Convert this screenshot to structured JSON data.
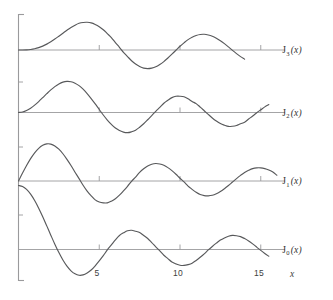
{
  "chart_data": {
    "type": "line",
    "title": "",
    "subtitle": "",
    "xlabel": "x",
    "ylabel": "",
    "xlim": [
      0,
      16.2
    ],
    "ylim": [
      -0.45,
      1.05
    ],
    "grid": false,
    "legend_position": "right-inline",
    "xticks": [
      5,
      10,
      15
    ],
    "xticklabels": [
      "5",
      "10",
      "15"
    ],
    "yticks": [],
    "yticklabels": [],
    "annotations": [],
    "series": [
      {
        "name": "J_0(x)",
        "label_base": "J",
        "label_sub": "0",
        "label_arg": "(x)",
        "baseline_value": 0,
        "x": [
          0,
          0.25,
          0.5,
          0.75,
          1,
          1.25,
          1.5,
          1.75,
          2,
          2.25,
          2.5,
          2.75,
          3,
          3.25,
          3.5,
          3.75,
          4,
          4.25,
          4.5,
          4.75,
          5,
          5.25,
          5.5,
          5.75,
          6,
          6.25,
          6.5,
          6.75,
          7,
          7.25,
          7.5,
          7.75,
          8,
          8.25,
          8.5,
          8.75,
          9,
          9.25,
          9.5,
          9.75,
          10,
          10.25,
          10.5,
          10.75,
          11,
          11.25,
          11.5,
          11.75,
          12,
          12.25,
          12.5,
          12.75,
          13,
          13.25,
          13.5,
          13.75,
          14,
          14.25,
          14.5,
          14.75,
          15,
          15.25,
          15.5
        ],
        "values": [
          1.0,
          0.9844,
          0.9385,
          0.8642,
          0.7652,
          0.6459,
          0.5118,
          0.369,
          0.2239,
          0.0827,
          -0.0484,
          -0.1641,
          -0.2601,
          -0.3332,
          -0.3801,
          -0.4026,
          -0.3971,
          -0.3673,
          -0.3205,
          -0.254,
          -0.1776,
          -0.0968,
          -0.0068,
          0.0717,
          0.1506,
          0.2196,
          0.2601,
          0.2929,
          0.3001,
          0.2856,
          0.2663,
          0.2196,
          0.1717,
          0.1084,
          0.0419,
          -0.0221,
          -0.0903,
          -0.1424,
          -0.1939,
          -0.2243,
          -0.2459,
          -0.249,
          -0.2366,
          -0.2142,
          -0.1712,
          -0.1219,
          -0.0677,
          -0.0068,
          0.0477,
          0.0989,
          0.1469,
          0.1813,
          0.2069,
          0.2199,
          0.215,
          0.2015,
          0.1711,
          0.1333,
          0.0884,
          0.038,
          -0.0142,
          -0.0618,
          -0.1055
        ]
      },
      {
        "name": "J_1(x)",
        "label_base": "J",
        "label_sub": "1",
        "label_arg": "(x)",
        "baseline_value": 0,
        "x": [
          0,
          0.25,
          0.5,
          0.75,
          1,
          1.25,
          1.5,
          1.75,
          2,
          2.25,
          2.5,
          2.75,
          3,
          3.25,
          3.5,
          3.75,
          4,
          4.25,
          4.5,
          4.75,
          5,
          5.25,
          5.5,
          5.75,
          6,
          6.25,
          6.5,
          6.75,
          7,
          7.25,
          7.5,
          7.75,
          8,
          8.25,
          8.5,
          8.75,
          9,
          9.25,
          9.5,
          9.75,
          10,
          10.25,
          10.5,
          10.75,
          11,
          11.25,
          11.5,
          11.75,
          12,
          12.25,
          12.5,
          12.75,
          13,
          13.25,
          13.5,
          13.75,
          14,
          14.25,
          14.5,
          14.75,
          15,
          15.25,
          15.5,
          15.75,
          16
        ],
        "values": [
          0.0,
          0.124,
          0.2423,
          0.3492,
          0.4401,
          0.5106,
          0.5579,
          0.5802,
          0.5767,
          0.5484,
          0.4971,
          0.4258,
          0.3391,
          0.2425,
          0.1374,
          0.0366,
          -0.066,
          -0.158,
          -0.2311,
          -0.295,
          -0.3276,
          -0.3414,
          -0.3414,
          -0.3148,
          -0.2767,
          -0.2212,
          -0.1538,
          -0.0826,
          -0.0047,
          0.0623,
          0.1352,
          0.1914,
          0.2346,
          0.2626,
          0.2731,
          0.2657,
          0.2453,
          0.209,
          0.1613,
          0.1061,
          0.0435,
          -0.0134,
          -0.0789,
          -0.1301,
          -0.1768,
          -0.2119,
          -0.2284,
          -0.232,
          -0.2234,
          -0.1997,
          -0.1655,
          -0.1206,
          -0.0703,
          -0.0162,
          0.038,
          0.0879,
          0.1334,
          0.1666,
          0.1934,
          0.2053,
          0.2051,
          0.1932,
          0.1712,
          0.1396,
          0.0904
        ]
      },
      {
        "name": "J_2(x)",
        "label_base": "J",
        "label_sub": "2",
        "label_arg": "(x)",
        "baseline_value": 0,
        "x": [
          0,
          0.25,
          0.5,
          0.75,
          1,
          1.25,
          1.5,
          1.75,
          2,
          2.25,
          2.5,
          2.75,
          3,
          3.25,
          3.5,
          3.75,
          4,
          4.25,
          4.5,
          4.75,
          5,
          5.25,
          5.5,
          5.75,
          6,
          6.25,
          6.5,
          6.75,
          7,
          7.25,
          7.5,
          7.75,
          8,
          8.25,
          8.5,
          8.75,
          9,
          9.25,
          9.5,
          9.75,
          10,
          10.25,
          10.5,
          10.75,
          11,
          11.25,
          11.5,
          11.75,
          12,
          12.25,
          12.5,
          12.75,
          13,
          13.25,
          13.5,
          13.75,
          14,
          14.25,
          14.5,
          14.75,
          15,
          15.25,
          15.5
        ],
        "values": [
          0.0,
          0.0078,
          0.0306,
          0.0671,
          0.1149,
          0.1711,
          0.2321,
          0.294,
          0.3528,
          0.4046,
          0.4461,
          0.4744,
          0.4861,
          0.4813,
          0.4586,
          0.4194,
          0.3641,
          0.2964,
          0.2178,
          0.1338,
          0.0466,
          -0.0392,
          -0.1173,
          -0.185,
          -0.2429,
          -0.2801,
          -0.3074,
          -0.3153,
          -0.3014,
          -0.2764,
          -0.2303,
          -0.1757,
          -0.113,
          -0.0477,
          0.0184,
          0.0793,
          0.1448,
          0.1915,
          0.2324,
          0.2538,
          0.2546,
          0.2457,
          0.2143,
          0.1723,
          0.139,
          0.085,
          0.028,
          -0.0296,
          -0.0849,
          -0.1329,
          -0.173,
          -0.1987,
          -0.2177,
          -0.2149,
          -0.2026,
          -0.1748,
          -0.152,
          -0.1022,
          -0.0547,
          -0.0034,
          0.0416,
          0.0876,
          0.124
        ]
      },
      {
        "name": "J_3(x)",
        "label_base": "J",
        "label_sub": "3",
        "label_arg": "(x)",
        "baseline_value": 0,
        "x": [
          0,
          0.25,
          0.5,
          0.75,
          1,
          1.25,
          1.5,
          1.75,
          2,
          2.25,
          2.5,
          2.75,
          3,
          3.25,
          3.5,
          3.75,
          4,
          4.25,
          4.5,
          4.75,
          5,
          5.25,
          5.5,
          5.75,
          6,
          6.25,
          6.5,
          6.75,
          7,
          7.25,
          7.5,
          7.75,
          8,
          8.25,
          8.5,
          8.75,
          9,
          9.25,
          9.5,
          9.75,
          10,
          10.25,
          10.5,
          10.75,
          11,
          11.25,
          11.5,
          11.75,
          12,
          12.25,
          12.5,
          12.75,
          13,
          13.25,
          13.5,
          13.75,
          14
        ],
        "values": [
          0.0,
          0.0003,
          0.0026,
          0.0085,
          0.0196,
          0.0369,
          0.061,
          0.0919,
          0.1289,
          0.1707,
          0.2161,
          0.2625,
          0.3091,
          0.3528,
          0.3879,
          0.4168,
          0.4302,
          0.4328,
          0.4247,
          0.4,
          0.3648,
          0.3173,
          0.2561,
          0.1935,
          0.1148,
          0.0424,
          -0.0354,
          -0.1026,
          -0.1676,
          -0.2194,
          -0.2581,
          -0.2837,
          -0.2911,
          -0.2835,
          -0.2633,
          -0.2264,
          -0.1809,
          -0.1249,
          -0.0653,
          -0.0038,
          0.0583,
          0.1119,
          0.162,
          0.2002,
          0.2273,
          0.2427,
          0.2457,
          0.2351,
          0.215,
          0.1839,
          0.1453,
          0.0993,
          0.0484,
          -0.005,
          -0.0561,
          -0.1033,
          -0.1429
        ]
      }
    ]
  },
  "axes": {
    "x_axis_label": "x",
    "y_axis_label": "",
    "x_tick_labels": [
      "5",
      "10",
      "15"
    ]
  },
  "labels": {
    "j0": "J0(x)",
    "j1": "J1(x)",
    "j2": "J2(x)",
    "j3": "J3(x)"
  },
  "colors": {
    "curve": "#58595b",
    "axis": "#9a9a9c",
    "text": "#404040",
    "background": "#ffffff"
  }
}
